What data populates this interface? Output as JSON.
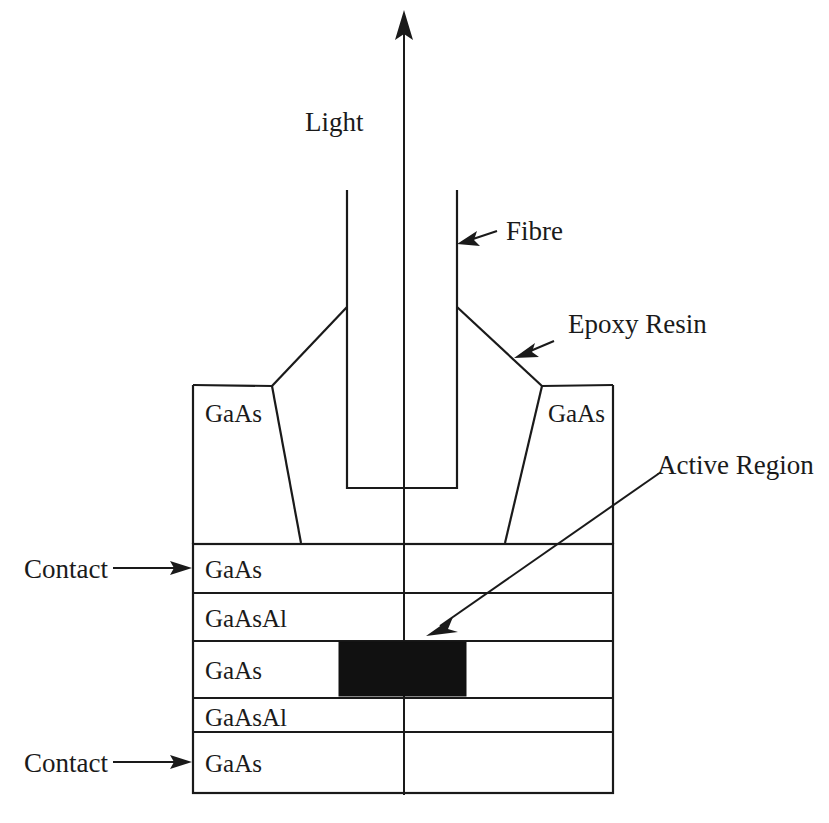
{
  "diagram": {
    "colors": {
      "line": "#1a1a1a",
      "active_region_fill": "#111111",
      "background": "#ffffff"
    },
    "callouts": {
      "light": "Light",
      "fibre": "Fibre",
      "epoxy_resin": "Epoxy Resin",
      "active_region": "Active Region",
      "contact_top": "Contact",
      "contact_bottom": "Contact"
    },
    "mesa_labels": {
      "left": "GaAs",
      "right": "GaAs"
    },
    "layers": [
      {
        "id": "layer-1",
        "material": "GaAs",
        "y_top": 544,
        "y_bottom": 593
      },
      {
        "id": "layer-2",
        "material": "GaAsAl",
        "y_top": 593,
        "y_bottom": 641
      },
      {
        "id": "layer-3",
        "material": "GaAs",
        "y_top": 641,
        "y_bottom": 698
      },
      {
        "id": "layer-4",
        "material": "GaAsAl",
        "y_top": 698,
        "y_bottom": 732
      },
      {
        "id": "layer-5",
        "material": "GaAs",
        "y_top": 732,
        "y_bottom": 793
      }
    ],
    "layer_materials": [
      "GaAs",
      "GaAsAl",
      "GaAs",
      "GaAsAl",
      "GaAs"
    ]
  }
}
